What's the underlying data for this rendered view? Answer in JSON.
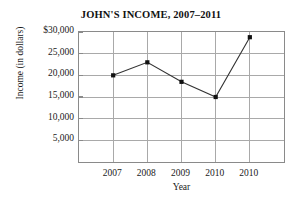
{
  "chart_data": {
    "type": "line",
    "title": "JOHN'S INCOME, 2007–2011",
    "xlabel": "Year",
    "ylabel": "Income (in dollars)",
    "categories": [
      "2007",
      "2008",
      "2009",
      "2010",
      "2010"
    ],
    "values": [
      20000,
      23000,
      18500,
      15000,
      28800
    ],
    "ylim": [
      0,
      30000
    ],
    "y_ticks": [
      5000,
      10000,
      15000,
      20000,
      25000,
      30000
    ],
    "y_tick_labels": [
      "5,000",
      "10,000",
      "15,000",
      "20,000",
      "25,000",
      "$30,000"
    ],
    "x_tick_labels": [
      "2007",
      "2008",
      "2009",
      "2010",
      "2010"
    ],
    "grid": true,
    "legend": false,
    "series": [
      {
        "name": "Income",
        "values": [
          20000,
          23000,
          18500,
          15000,
          28800
        ]
      }
    ],
    "colors": {
      "line": "#333333",
      "marker": "#111111",
      "grid": "#a9a9a9",
      "frame": "#8a8a8a",
      "background": "#ffffff",
      "text": "#1a1a1a"
    }
  }
}
